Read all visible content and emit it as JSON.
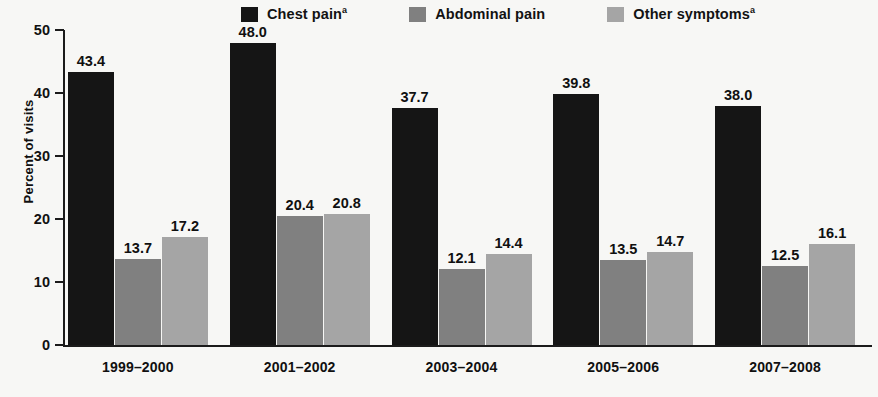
{
  "chart_data": {
    "type": "bar",
    "title": "",
    "xlabel": "",
    "ylabel": "Percent of visits",
    "ylim": [
      0,
      50
    ],
    "yticks": [
      0,
      10,
      20,
      30,
      40,
      50
    ],
    "ytick_labels": [
      "0",
      "10",
      "20",
      "30",
      "40",
      "50"
    ],
    "grid": false,
    "legend_position": "top-center",
    "categories": [
      "1999–2000",
      "2001–2002",
      "2003–2004",
      "2005–2006",
      "2007–2008"
    ],
    "series": [
      {
        "name": "Chest pain",
        "footnote_marker": "a",
        "color": "#151515",
        "values": [
          43.4,
          48.0,
          37.7,
          39.8,
          38.0
        ],
        "value_labels": [
          "43.4",
          "48.0",
          "37.7",
          "39.8",
          "38.0"
        ]
      },
      {
        "name": "Abdominal pain",
        "footnote_marker": "",
        "color": "#808080",
        "values": [
          13.7,
          20.4,
          12.1,
          13.5,
          12.5
        ],
        "value_labels": [
          "13.7",
          "20.4",
          "12.1",
          "13.5",
          "12.5"
        ]
      },
      {
        "name": "Other symptoms",
        "footnote_marker": "a",
        "color": "#a5a5a5",
        "values": [
          17.2,
          20.8,
          14.4,
          14.7,
          16.1
        ],
        "value_labels": [
          "17.2",
          "20.8",
          "14.4",
          "14.7",
          "16.1"
        ]
      }
    ]
  },
  "legend": {
    "items": [
      {
        "label": "Chest pain",
        "marker": "a",
        "color": "#151515"
      },
      {
        "label": "Abdominal pain",
        "marker": "",
        "color": "#808080"
      },
      {
        "label": "Other symptoms",
        "marker": "a",
        "color": "#a5a5a5"
      }
    ]
  },
  "axes": {
    "y_title": "Percent of visits"
  }
}
